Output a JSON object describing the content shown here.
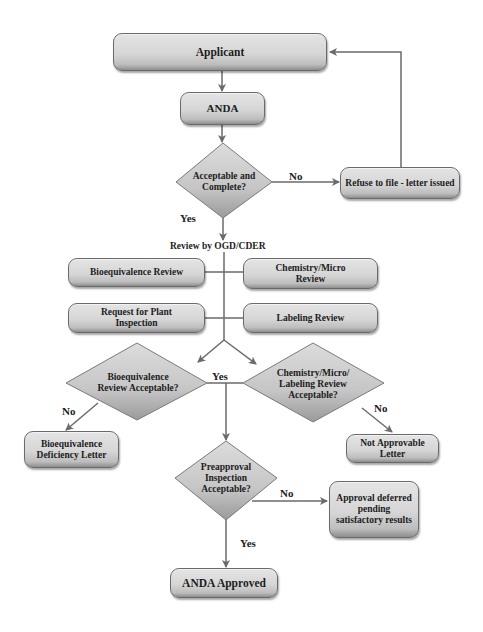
{
  "colors": {
    "box_fill": "#d6d6d6",
    "diamond_fill": "#c9c9c9",
    "line": "#6a6a6a",
    "text": "#1c1c1c",
    "background": "#ffffff"
  },
  "nodes": {
    "applicant": {
      "label": "Applicant"
    },
    "anda": {
      "label": "ANDA"
    },
    "acceptable_complete": {
      "label": "Acceptable and Complete?"
    },
    "refuse_to_file": {
      "label": "Refuse to file - letter issued"
    },
    "review_by": {
      "label": "Review by OGD/CDER"
    },
    "bioequivalence_review": {
      "label": "Bioequivalence Review"
    },
    "chemistry_micro_review": {
      "label": "Chemistry/Micro Review"
    },
    "request_plant_inspection": {
      "label": "Request for Plant Inspection"
    },
    "labeling_review": {
      "label": "Labeling Review"
    },
    "bioequivalence_acceptable": {
      "label": "Bioequivalence Review Acceptable?"
    },
    "chem_label_acceptable": {
      "label": "Chemistry/Micro/ Labeling Review Acceptable?"
    },
    "bioequivalence_deficiency": {
      "label": "Bioequivalence Deficiency Letter"
    },
    "not_approvable": {
      "label": "Not Approvable Letter"
    },
    "preapproval_inspection": {
      "label": "Preapproval Inspection Acceptable?"
    },
    "approval_deferred": {
      "label": "Approval deferred pending satisfactory results"
    },
    "anda_approved": {
      "label": "ANDA Approved"
    }
  },
  "edge_labels": {
    "no_refuse": "No",
    "yes_review": "Yes",
    "yes_middle": "Yes",
    "no_bio": "No",
    "no_chem": "No",
    "no_preapproval": "No",
    "yes_approved": "Yes"
  }
}
